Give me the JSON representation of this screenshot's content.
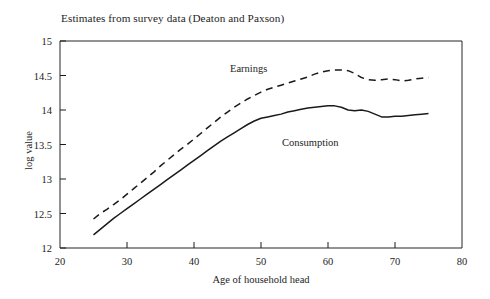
{
  "chart_data": {
    "type": "line",
    "title": "Estimates from survey data (Deaton and Paxson)",
    "xlabel": "Age of household head",
    "ylabel": "log value",
    "xlim": [
      20,
      80
    ],
    "ylim": [
      12,
      15
    ],
    "xticks": [
      20,
      30,
      40,
      50,
      60,
      70,
      80
    ],
    "yticks": [
      12,
      12.5,
      13,
      13.5,
      14,
      14.5,
      15
    ],
    "xtick_labels": [
      "20",
      "30",
      "40",
      "50",
      "60",
      "70",
      "80"
    ],
    "ytick_labels": [
      "12",
      "12.5",
      "13",
      "13.5",
      "14",
      "14.5",
      "15"
    ],
    "grid": false,
    "legend_position": "inline-annotations",
    "series": [
      {
        "name": "Earnings",
        "style": "dashed",
        "color": "#1a1a1a",
        "x": [
          25,
          26,
          27,
          28,
          29,
          30,
          31,
          32,
          33,
          34,
          35,
          36,
          37,
          38,
          39,
          40,
          41,
          42,
          43,
          44,
          45,
          46,
          47,
          48,
          49,
          50,
          51,
          52,
          53,
          54,
          55,
          56,
          57,
          58,
          59,
          60,
          61,
          62,
          63,
          64,
          65,
          66,
          67,
          68,
          69,
          70,
          71,
          72,
          73,
          74,
          75
        ],
        "values": [
          12.42,
          12.5,
          12.56,
          12.63,
          12.7,
          12.78,
          12.86,
          12.94,
          13.02,
          13.1,
          13.19,
          13.27,
          13.35,
          13.43,
          13.5,
          13.58,
          13.66,
          13.74,
          13.82,
          13.9,
          13.97,
          14.04,
          14.1,
          14.16,
          14.21,
          14.26,
          14.3,
          14.33,
          14.36,
          14.39,
          14.42,
          14.45,
          14.48,
          14.52,
          14.55,
          14.57,
          14.58,
          14.58,
          14.57,
          14.53,
          14.47,
          14.44,
          14.43,
          14.44,
          14.45,
          14.44,
          14.42,
          14.43,
          14.45,
          14.46,
          14.47
        ]
      },
      {
        "name": "Consumption",
        "style": "solid",
        "color": "#1a1a1a",
        "x": [
          25,
          26,
          27,
          28,
          29,
          30,
          31,
          32,
          33,
          34,
          35,
          36,
          37,
          38,
          39,
          40,
          41,
          42,
          43,
          44,
          45,
          46,
          47,
          48,
          49,
          50,
          51,
          52,
          53,
          54,
          55,
          56,
          57,
          58,
          59,
          60,
          61,
          62,
          63,
          64,
          65,
          66,
          67,
          68,
          69,
          70,
          71,
          72,
          73,
          74,
          75
        ],
        "values": [
          12.19,
          12.27,
          12.35,
          12.43,
          12.5,
          12.57,
          12.64,
          12.71,
          12.78,
          12.85,
          12.92,
          12.99,
          13.06,
          13.13,
          13.2,
          13.27,
          13.34,
          13.41,
          13.48,
          13.55,
          13.61,
          13.67,
          13.73,
          13.79,
          13.84,
          13.88,
          13.9,
          13.92,
          13.94,
          13.97,
          13.99,
          14.01,
          14.03,
          14.04,
          14.05,
          14.06,
          14.06,
          14.04,
          14.0,
          13.99,
          14.0,
          13.98,
          13.94,
          13.9,
          13.9,
          13.91,
          13.91,
          13.92,
          13.93,
          13.94,
          13.95
        ]
      }
    ],
    "annotations": [
      {
        "text": "Earnings",
        "series": "Earnings"
      },
      {
        "text": "Consumption",
        "series": "Consumption"
      }
    ]
  }
}
